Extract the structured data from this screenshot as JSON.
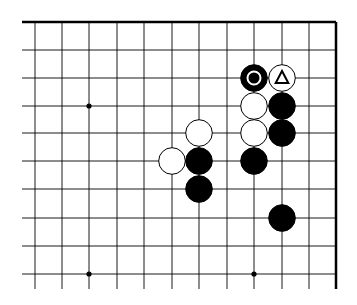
{
  "diagram": {
    "type": "go-board-fragment",
    "edges": [
      "top",
      "right"
    ],
    "grid": {
      "columns_x": [
        35,
        62,
        89,
        117,
        144,
        172,
        199,
        227,
        254,
        282,
        309,
        336
      ],
      "rows_y": [
        22,
        50,
        78,
        106,
        133,
        161,
        189,
        218,
        246,
        274
      ],
      "line_start_x": 22,
      "line_end_y": 289
    },
    "star_points": [
      {
        "col": 2,
        "row": 3
      },
      {
        "col": 2,
        "row": 9
      },
      {
        "col": 8,
        "row": 9
      }
    ],
    "stones": [
      {
        "color": "black",
        "col": 8,
        "row": 2,
        "mark": "circle"
      },
      {
        "color": "white",
        "col": 9,
        "row": 2,
        "mark": "triangle"
      },
      {
        "color": "white",
        "col": 8,
        "row": 3
      },
      {
        "color": "black",
        "col": 9,
        "row": 3
      },
      {
        "color": "white",
        "col": 6,
        "row": 4
      },
      {
        "color": "white",
        "col": 8,
        "row": 4
      },
      {
        "color": "black",
        "col": 9,
        "row": 4
      },
      {
        "color": "white",
        "col": 5,
        "row": 5
      },
      {
        "color": "black",
        "col": 6,
        "row": 5
      },
      {
        "color": "black",
        "col": 8,
        "row": 5
      },
      {
        "color": "black",
        "col": 6,
        "row": 6
      },
      {
        "color": "black",
        "col": 9,
        "row": 7
      }
    ],
    "colors": {
      "black": "#000000",
      "white": "#ffffff",
      "line": "#000000"
    }
  }
}
